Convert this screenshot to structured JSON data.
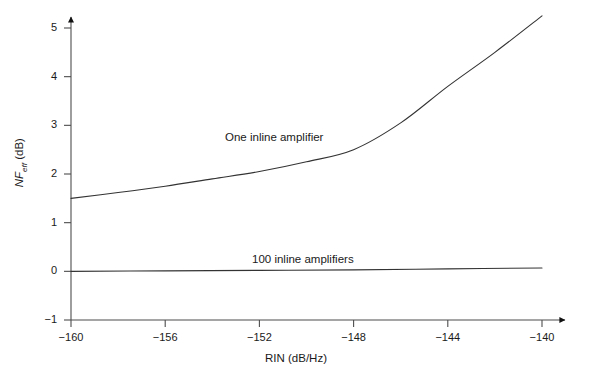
{
  "chart_data": {
    "type": "line",
    "title": "",
    "subtitle": "",
    "xlabel": "RIN (dB/Hz)",
    "ylabel": "NF_eff (dB)",
    "ylabel_parts": {
      "symbol": "NF",
      "subscript": "eff",
      "unit": "(dB)"
    },
    "xlim": [
      -160,
      -140
    ],
    "ylim": [
      -1,
      5
    ],
    "xticks": [
      -160,
      -156,
      -152,
      -148,
      -144,
      -140
    ],
    "xtick_labels": [
      "−160",
      "−156",
      "−152",
      "−148",
      "−144",
      "−140"
    ],
    "yticks": [
      -1,
      0,
      1,
      2,
      3,
      4,
      5
    ],
    "ytick_labels": [
      "−1",
      "0",
      "1",
      "2",
      "3",
      "4",
      "5"
    ],
    "grid": false,
    "legend_position": "inline-annotations",
    "axis_arrows": {
      "x": true,
      "y": true
    },
    "line_color": "#333333",
    "axis_color": "#4d4d4d",
    "series": [
      {
        "name": "One inline amplifier",
        "annotation": "One inline amplifier",
        "x": [
          -160,
          -158,
          -156,
          -154,
          -152,
          -150,
          -148,
          -146,
          -144,
          -142,
          -140
        ],
        "values": [
          1.5,
          1.62,
          1.75,
          1.9,
          2.05,
          2.25,
          2.5,
          3.05,
          3.8,
          4.5,
          5.25
        ]
      },
      {
        "name": "100 inline amplifiers",
        "annotation": "100 inline amplifiers",
        "x": [
          -160,
          -156,
          -152,
          -148,
          -144,
          -140
        ],
        "values": [
          0.0,
          0.01,
          0.02,
          0.03,
          0.05,
          0.07
        ]
      }
    ]
  }
}
